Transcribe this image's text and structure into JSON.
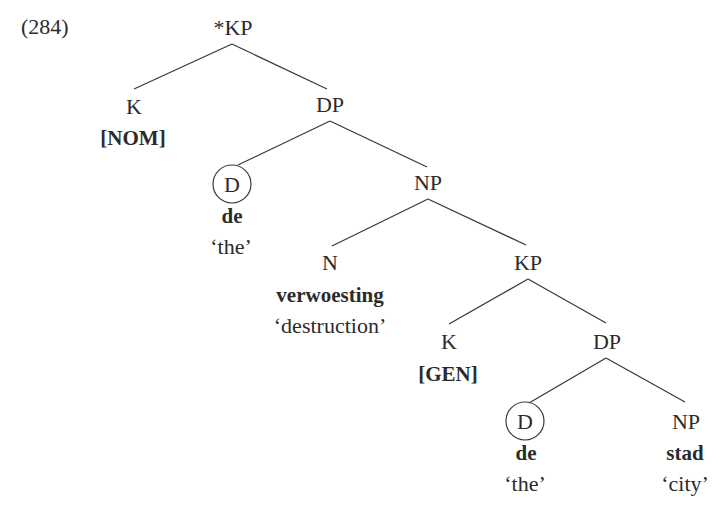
{
  "example_number": "(284)",
  "tree": {
    "root": {
      "label": "*KP"
    },
    "k_nom": {
      "label": "K",
      "feature": "[NOM]"
    },
    "dp1": {
      "label": "DP"
    },
    "d1": {
      "label": "D",
      "circled": true,
      "word": "de",
      "gloss": "‘the’"
    },
    "np1": {
      "label": "NP"
    },
    "n": {
      "label": "N",
      "word": "verwoesting",
      "gloss": "‘destruction’"
    },
    "kp": {
      "label": "KP"
    },
    "k_gen": {
      "label": "K",
      "feature": "[GEN]"
    },
    "dp2": {
      "label": "DP"
    },
    "d2": {
      "label": "D",
      "circled": true,
      "word": "de",
      "gloss": "‘the’"
    },
    "np2": {
      "label": "NP",
      "word": "stad",
      "gloss": "‘city’"
    }
  },
  "edges": [
    [
      "*KP",
      "K[NOM]"
    ],
    [
      "*KP",
      "DP"
    ],
    [
      "DP",
      "D"
    ],
    [
      "DP",
      "NP"
    ],
    [
      "NP",
      "N"
    ],
    [
      "NP",
      "KP"
    ],
    [
      "KP",
      "K[GEN]"
    ],
    [
      "KP",
      "DP"
    ],
    [
      "DP",
      "D"
    ],
    [
      "DP",
      "NP"
    ]
  ],
  "colors": {
    "text": "#2b2b2b",
    "lines": "#3a3a3a",
    "background": "#ffffff"
  }
}
